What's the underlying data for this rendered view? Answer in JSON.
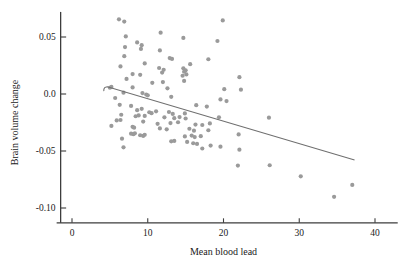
{
  "chart_data": {
    "type": "scatter",
    "title": "",
    "xlabel": "Mean blood lead",
    "ylabel": "Brain volume change",
    "xlim": [
      -1.5,
      43
    ],
    "ylim": [
      -0.113,
      0.072
    ],
    "xticks": [
      0,
      10,
      20,
      30,
      40
    ],
    "xtick_labels": [
      "0",
      "10",
      "20",
      "30",
      "40"
    ],
    "yticks": [
      0.05,
      0.0,
      -0.05,
      -0.1
    ],
    "ytick_labels": [
      "0.05",
      "0.0",
      "-0.05",
      "-0.10"
    ],
    "grid": false,
    "legend": null,
    "marker": {
      "color": "#9a9a9a",
      "size": 2.1,
      "shape": "circle"
    },
    "points": [
      [
        6.2,
        0.0655
      ],
      [
        6.9,
        0.0635
      ],
      [
        19.9,
        0.0645
      ],
      [
        7.1,
        0.0505
      ],
      [
        11.7,
        0.0538
      ],
      [
        14.7,
        0.0492
      ],
      [
        19.2,
        0.0465
      ],
      [
        8.6,
        0.0452
      ],
      [
        9.2,
        0.0428
      ],
      [
        7.0,
        0.0412
      ],
      [
        9.1,
        0.0395
      ],
      [
        11.6,
        0.0382
      ],
      [
        6.9,
        0.0332
      ],
      [
        12.9,
        0.0315
      ],
      [
        13.2,
        0.0308
      ],
      [
        18.0,
        0.0305
      ],
      [
        9.6,
        0.0268
      ],
      [
        15.6,
        0.0262
      ],
      [
        6.4,
        0.0242
      ],
      [
        11.5,
        0.0228
      ],
      [
        12.1,
        0.0212
      ],
      [
        14.7,
        0.0225
      ],
      [
        15.0,
        0.0208
      ],
      [
        14.8,
        0.0195
      ],
      [
        11.9,
        0.0188
      ],
      [
        8.0,
        0.0175
      ],
      [
        9.0,
        0.0168
      ],
      [
        15.1,
        0.0172
      ],
      [
        14.6,
        0.016
      ],
      [
        22.1,
        0.0148
      ],
      [
        7.2,
        0.0132
      ],
      [
        12.0,
        0.0105
      ],
      [
        10.6,
        0.0098
      ],
      [
        14.8,
        0.0115
      ],
      [
        5.0,
        0.0055
      ],
      [
        5.2,
        0.0062
      ],
      [
        8.0,
        0.0058
      ],
      [
        12.6,
        0.005
      ],
      [
        20.1,
        0.0042
      ],
      [
        22.3,
        0.0038
      ],
      [
        6.8,
        0.0012
      ],
      [
        9.3,
        0.0008
      ],
      [
        9.8,
        -0.0005
      ],
      [
        10.0,
        -0.0012
      ],
      [
        13.1,
        -0.0025
      ],
      [
        5.7,
        -0.0035
      ],
      [
        19.6,
        -0.0048
      ],
      [
        20.4,
        -0.0062
      ],
      [
        6.3,
        -0.0095
      ],
      [
        7.8,
        -0.0105
      ],
      [
        16.4,
        -0.0098
      ],
      [
        17.8,
        -0.011
      ],
      [
        9.2,
        -0.013
      ],
      [
        8.6,
        -0.0142
      ],
      [
        11.1,
        -0.0152
      ],
      [
        10.2,
        -0.016
      ],
      [
        10.5,
        -0.0168
      ],
      [
        12.8,
        -0.0158
      ],
      [
        13.3,
        -0.0175
      ],
      [
        14.9,
        -0.017
      ],
      [
        6.5,
        -0.0182
      ],
      [
        8.4,
        -0.0195
      ],
      [
        8.8,
        -0.0188
      ],
      [
        9.6,
        -0.0192
      ],
      [
        12.2,
        -0.0205
      ],
      [
        13.5,
        -0.0212
      ],
      [
        14.2,
        -0.0202
      ],
      [
        15.0,
        -0.0215
      ],
      [
        19.4,
        -0.0205
      ],
      [
        26.0,
        -0.0208
      ],
      [
        5.9,
        -0.0232
      ],
      [
        6.4,
        -0.0228
      ],
      [
        9.4,
        -0.0242
      ],
      [
        11.3,
        -0.0262
      ],
      [
        13.0,
        -0.0255
      ],
      [
        14.0,
        -0.0248
      ],
      [
        16.3,
        -0.0268
      ],
      [
        17.2,
        -0.0272
      ],
      [
        18.2,
        -0.0258
      ],
      [
        5.2,
        -0.028
      ],
      [
        8.0,
        -0.0288
      ],
      [
        8.2,
        -0.0295
      ],
      [
        11.6,
        -0.0302
      ],
      [
        12.5,
        -0.031
      ],
      [
        15.5,
        -0.0305
      ],
      [
        16.1,
        -0.0322
      ],
      [
        18.0,
        -0.0318
      ],
      [
        7.8,
        -0.0348
      ],
      [
        8.1,
        -0.0352
      ],
      [
        8.3,
        -0.0345
      ],
      [
        9.0,
        -0.0362
      ],
      [
        9.4,
        -0.0368
      ],
      [
        9.6,
        -0.0358
      ],
      [
        14.9,
        -0.0372
      ],
      [
        15.8,
        -0.0365
      ],
      [
        16.2,
        -0.0378
      ],
      [
        17.0,
        -0.037
      ],
      [
        22.0,
        -0.0355
      ],
      [
        6.6,
        -0.0392
      ],
      [
        13.1,
        -0.0415
      ],
      [
        13.5,
        -0.0412
      ],
      [
        15.2,
        -0.042
      ],
      [
        16.0,
        -0.0432
      ],
      [
        16.5,
        -0.0438
      ],
      [
        18.3,
        -0.0452
      ],
      [
        19.6,
        -0.0462
      ],
      [
        6.8,
        -0.0468
      ],
      [
        22.1,
        -0.0488
      ],
      [
        17.2,
        -0.0478
      ],
      [
        21.9,
        -0.0628
      ],
      [
        26.1,
        -0.0625
      ],
      [
        30.2,
        -0.0722
      ],
      [
        37.0,
        -0.0798
      ],
      [
        34.6,
        -0.0902
      ]
    ],
    "regression_line": {
      "x_start": 4.2,
      "y_start": 0.0065,
      "x_end": 37.3,
      "y_end": -0.0578,
      "color": "#6f6f6f"
    }
  },
  "axes": {
    "line_color": "#3d3d3d"
  }
}
